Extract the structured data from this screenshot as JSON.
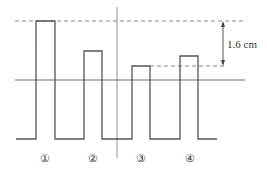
{
  "diagram": {
    "measurement_label": "1.6 cm",
    "pulse_labels": [
      "①",
      "②",
      "③",
      "④"
    ],
    "colors": {
      "line": "#555555",
      "dash": "#888888",
      "text": "#333333"
    },
    "pulses": [
      {
        "x0": 36,
        "x1": 55,
        "top": 21
      },
      {
        "x0": 84,
        "x1": 102,
        "top": 51
      },
      {
        "x0": 132,
        "x1": 150,
        "top": 66
      },
      {
        "x0": 180,
        "x1": 198,
        "top": 56
      }
    ],
    "baseline_y": 139,
    "reference_line_y": 80,
    "vertical_line_x": 117,
    "top_dashed_y": 21,
    "lower_dashed_y": 66
  }
}
